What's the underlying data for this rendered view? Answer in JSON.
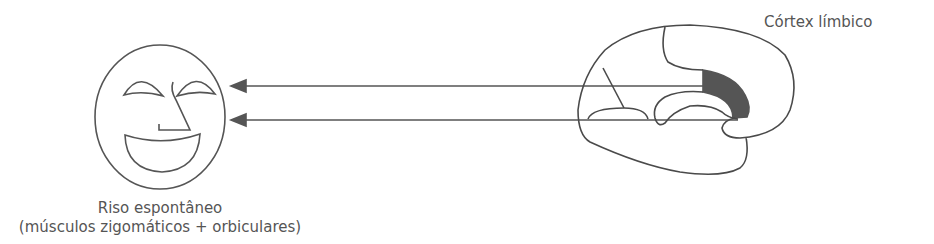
{
  "diagram": {
    "brain": {
      "label": "Córtex límbico",
      "highlight_color": "#555555",
      "stroke_color": "#4a4a4a"
    },
    "face": {
      "label_line1": "Riso espontâneo",
      "label_line2": "(músculos zigomáticos + orbiculares)",
      "stroke_color": "#555555"
    },
    "arrows": [
      {
        "from": "brain",
        "to": "face",
        "y": 86
      },
      {
        "from": "brain",
        "to": "face",
        "y": 120
      }
    ],
    "arrow_color": "#555555"
  }
}
